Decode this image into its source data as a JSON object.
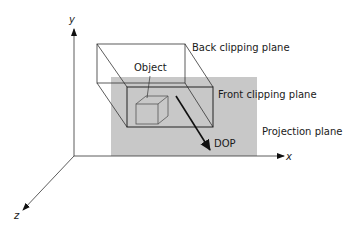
{
  "diagram": {
    "labels": {
      "y_axis": "y",
      "x_axis": "x",
      "z_axis": "z",
      "object": "Object",
      "back_plane": "Back clipping plane",
      "front_plane": "Front clipping plane",
      "projection_plane": "Projection plane",
      "dop": "DOP"
    },
    "colors": {
      "projection_plane_fill": "#c8c8c8",
      "line": "#222222"
    }
  }
}
